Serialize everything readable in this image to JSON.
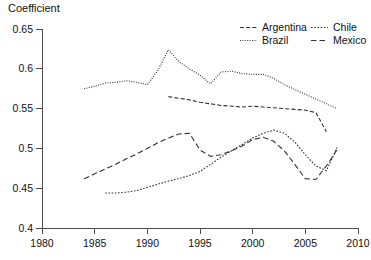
{
  "chart_data": {
    "type": "line",
    "title": "",
    "ylabel": "Coefficient",
    "xlabel": "",
    "xlim": [
      1980,
      2010
    ],
    "ylim": [
      0.4,
      0.65
    ],
    "xticks": [
      1980,
      1985,
      1990,
      1995,
      2000,
      2005,
      2010
    ],
    "yticks": [
      0.4,
      0.45,
      0.5,
      0.55,
      0.6,
      0.65
    ],
    "xtick_labels": [
      "1980",
      "1985",
      "1990",
      "1995",
      "2000",
      "2005",
      "2010"
    ],
    "ytick_labels": [
      "0.4",
      "0.45",
      "0.5",
      "0.55",
      "0.6",
      "0.65"
    ],
    "grid": false,
    "legend_position": "top-right",
    "line_color": "#333333",
    "series": [
      {
        "name": "Argentina",
        "dash": "dashdot",
        "dasharray": "4,2.2",
        "x": [
          1992,
          1993,
          1994,
          1995,
          1996,
          1997,
          1998,
          1999,
          2000,
          2001,
          2002,
          2003,
          2004,
          2005,
          2006,
          2007
        ],
        "y": [
          0.565,
          0.563,
          0.561,
          0.558,
          0.556,
          0.554,
          0.553,
          0.552,
          0.553,
          0.552,
          0.551,
          0.55,
          0.549,
          0.548,
          0.545,
          0.521
        ]
      },
      {
        "name": "Brazil",
        "dash": "dotted",
        "dasharray": "1,1.4",
        "x": [
          1984,
          1985,
          1986,
          1987,
          1988,
          1989,
          1990,
          1991,
          1992,
          1993,
          1994,
          1995,
          1996,
          1997,
          1998,
          1999,
          2000,
          2001,
          2002,
          2003,
          2004,
          2005,
          2006,
          2007,
          2008
        ],
        "y": [
          0.575,
          0.578,
          0.582,
          0.583,
          0.585,
          0.583,
          0.58,
          0.598,
          0.624,
          0.609,
          0.6,
          0.592,
          0.581,
          0.596,
          0.597,
          0.594,
          0.593,
          0.593,
          0.588,
          0.58,
          0.574,
          0.568,
          0.562,
          0.556,
          0.55
        ]
      },
      {
        "name": "Chile",
        "dash": "dotted",
        "dasharray": "1.6,1.6",
        "x": [
          1986,
          1987,
          1988,
          1989,
          1990,
          1991,
          1992,
          1993,
          1994,
          1995,
          1996,
          1997,
          1998,
          1999,
          2000,
          2001,
          2002,
          2003,
          2004,
          2005,
          2006,
          2007,
          2008
        ],
        "y": [
          0.444,
          0.444,
          0.445,
          0.447,
          0.451,
          0.455,
          0.459,
          0.462,
          0.466,
          0.471,
          0.48,
          0.489,
          0.497,
          0.505,
          0.513,
          0.519,
          0.523,
          0.519,
          0.508,
          0.492,
          0.478,
          0.472,
          0.501
        ]
      },
      {
        "name": "Mexico",
        "dash": "dashed",
        "dasharray": "5.5,3",
        "x": [
          1984,
          1985,
          1986,
          1987,
          1988,
          1989,
          1990,
          1991,
          1992,
          1993,
          1994,
          1995,
          1996,
          1997,
          1998,
          1999,
          2000,
          2001,
          2002,
          2003,
          2004,
          2005,
          2006,
          2007,
          2008
        ],
        "y": [
          0.462,
          0.468,
          0.474,
          0.48,
          0.487,
          0.493,
          0.5,
          0.507,
          0.513,
          0.518,
          0.519,
          0.498,
          0.49,
          0.492,
          0.497,
          0.503,
          0.511,
          0.514,
          0.509,
          0.497,
          0.48,
          0.462,
          0.461,
          0.478,
          0.498
        ]
      }
    ],
    "legend_entries": [
      {
        "label": "Argentina",
        "dasharray": "4,2.2"
      },
      {
        "label": "Chile",
        "dasharray": "1.6,1.6"
      },
      {
        "label": "Brazil",
        "dasharray": "1,1.4"
      },
      {
        "label": "Mexico",
        "dasharray": "5.5,3"
      }
    ]
  }
}
